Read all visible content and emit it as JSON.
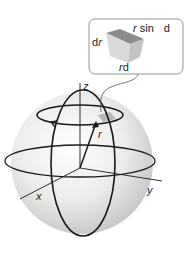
{
  "diagram": {
    "axes": {
      "x_label": "x",
      "y_label": "y",
      "z_label": "z"
    },
    "vector_label": "r",
    "callout": {
      "dr_prefix": "d",
      "dr_var": "r",
      "top_var": "r",
      "top_rest": " sin",
      "top_d": "d",
      "bottom_var": "r",
      "bottom_rest": "d"
    },
    "colors": {
      "line": "#1a1a1a",
      "sphere_light": "#ffffff",
      "sphere_dark": "#c8c8c8",
      "box_border": "#8a8a8a",
      "cube_top": "#8c8c8c",
      "cube_front": "#d9d9d9",
      "cube_side": "#c4c4c4"
    }
  }
}
